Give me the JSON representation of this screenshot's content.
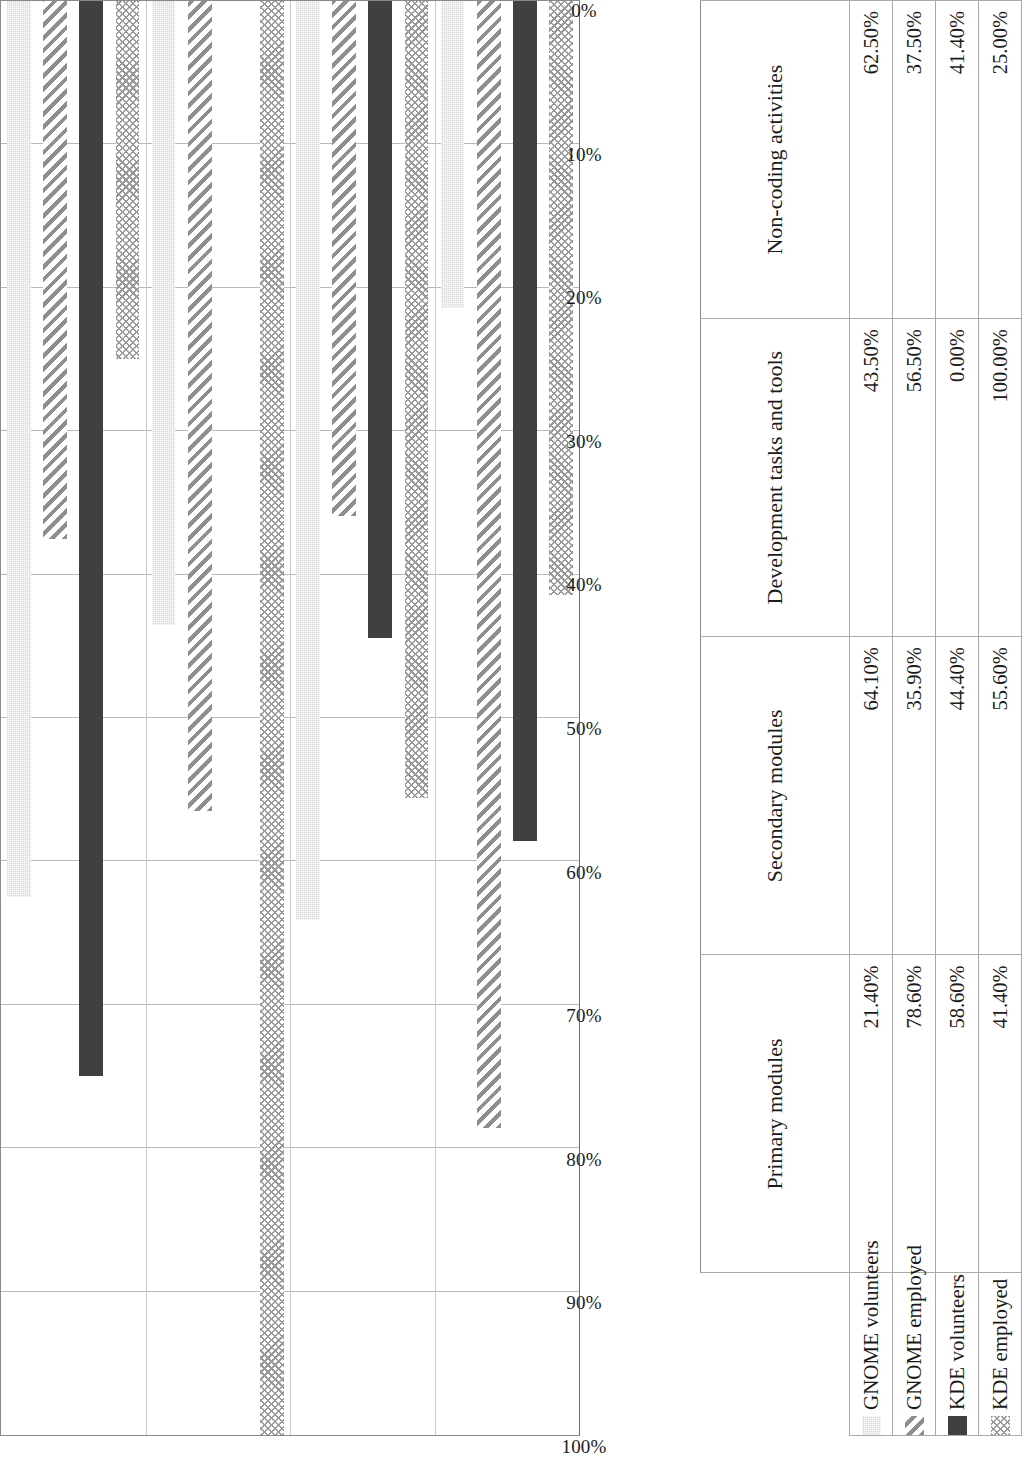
{
  "chart_data": {
    "type": "bar",
    "orientation": "horizontal",
    "title": "",
    "subtitle": "",
    "xlabel": "",
    "ylabel": "",
    "grid": true,
    "legend_position": "bottom-table",
    "page_rotation": "-90deg",
    "value_axis": {
      "min": 0,
      "max": 100,
      "unit": "%",
      "direction": "100% at left to 0% at right",
      "tick_labels": [
        "100%",
        "90%",
        "80%",
        "70%",
        "60%",
        "50%",
        "40%",
        "30%",
        "20%",
        "10%",
        "0%"
      ],
      "tick_values": [
        100,
        90,
        80,
        70,
        60,
        50,
        40,
        30,
        20,
        10,
        0
      ]
    },
    "categories": [
      "Non-coding activities",
      "Development tasks and tools",
      "Secondary modules",
      "Primary modules"
    ],
    "series": [
      {
        "name": "GNOME volunteers",
        "pattern": "light-gray-noise",
        "swatch_class": "pat-light",
        "values": [
          62.5,
          43.5,
          64.1,
          21.4
        ],
        "labels": [
          "62.50%",
          "43.50%",
          "64.10%",
          "21.40%"
        ]
      },
      {
        "name": "GNOME employed",
        "pattern": "diagonal-hatch",
        "swatch_class": "pat-diag",
        "values": [
          37.5,
          56.5,
          35.9,
          78.6
        ],
        "labels": [
          "37.50%",
          "56.50%",
          "35.90%",
          "78.60%"
        ]
      },
      {
        "name": "KDE volunteers",
        "pattern": "solid-dark-gray",
        "swatch_class": "pat-solid",
        "values": [
          75.0,
          0.0,
          44.4,
          58.6
        ],
        "labels": [
          "75.00%",
          "0.00%",
          "44.40%",
          "58.60%"
        ]
      },
      {
        "name": "KDE employed",
        "pattern": "crosshatch",
        "swatch_class": "pat-cross",
        "values": [
          25.0,
          100.0,
          55.6,
          41.4
        ],
        "labels": [
          "25.00%",
          "100.00%",
          "55.60%",
          "41.40%"
        ]
      }
    ],
    "colors": {
      "light_gray": "#dcdcdc",
      "hatch_gray": "#8f8f8f",
      "solid_dark": "#404040",
      "cross_gray": "#9a9a9a",
      "gridline": "#b9b9b9",
      "axis_line": "#8a8a8a",
      "table_border": "#a9a9a9",
      "text": "#1b1b1b"
    }
  },
  "table": {
    "column_headers": [
      "Primary modules",
      "Secondary modules",
      "Development tasks and tools",
      "Non-coding activities"
    ],
    "rows": [
      {
        "series": "GNOME volunteers",
        "swatch": "pat-light",
        "cells": [
          "21.40%",
          "64.10%",
          "43.50%",
          "62.50%"
        ]
      },
      {
        "series": "GNOME employed",
        "swatch": "pat-diag",
        "cells": [
          "78.60%",
          "35.90%",
          "56.50%",
          "37.50%"
        ]
      },
      {
        "series": "KDE volunteers",
        "swatch": "pat-solid",
        "cells": [
          "58.60%",
          "44.40%",
          "0.00%",
          "41.40%"
        ]
      },
      {
        "series": "KDE employed",
        "swatch": "pat-cross",
        "cells": [
          "41.40%",
          "55.60%",
          "100.00%",
          "25.00%"
        ]
      }
    ]
  }
}
